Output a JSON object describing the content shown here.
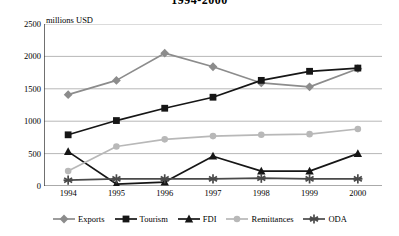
{
  "chart_data": {
    "type": "line",
    "title": "1994-2000",
    "xlabel": "",
    "ylabel": "",
    "unit_label": "millions USD",
    "categories": [
      "1994",
      "1995",
      "1996",
      "1997",
      "1998",
      "1999",
      "2000"
    ],
    "x": [
      1994,
      1995,
      1996,
      1997,
      1998,
      1999,
      2000
    ],
    "ylim": [
      0,
      2500
    ],
    "yticks": [
      0,
      500,
      1000,
      1500,
      2000,
      2500
    ],
    "ytick_labels": [
      "0",
      "500",
      "1000",
      "1500",
      "2000",
      "2500"
    ],
    "grid": true,
    "grid_axis": "y",
    "legend_position": "bottom",
    "series": [
      {
        "name": "Exports",
        "marker": "diamond",
        "color": "#8c8c8c",
        "line_color": "#8c8c8c",
        "values": [
          1410,
          1630,
          2050,
          1840,
          1590,
          1530,
          1810
        ]
      },
      {
        "name": "Tourism",
        "marker": "square",
        "color": "#161616",
        "line_color": "#161616",
        "values": [
          790,
          1010,
          1200,
          1370,
          1630,
          1770,
          1820
        ]
      },
      {
        "name": "FDI",
        "marker": "triangle",
        "color": "#161616",
        "line_color": "#161616",
        "values": [
          530,
          30,
          60,
          460,
          230,
          230,
          500
        ]
      },
      {
        "name": "Remittances",
        "marker": "circle",
        "color": "#b8b8b8",
        "line_color": "#b8b8b8",
        "values": [
          230,
          610,
          720,
          770,
          790,
          800,
          880
        ]
      },
      {
        "name": "ODA",
        "marker": "asterisk",
        "color": "#4a4a4a",
        "line_color": "#4a4a4a",
        "values": [
          90,
          110,
          110,
          110,
          120,
          110,
          110
        ]
      }
    ]
  }
}
